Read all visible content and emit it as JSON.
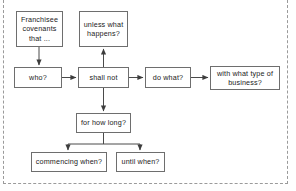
{
  "figure": {
    "type": "flowchart",
    "border_style": "dashed",
    "border_color": "#9a9a9a",
    "background": "#ffffff",
    "line_color": "#4a4a4a",
    "box_border_color": "#6e6e6e",
    "text_color": "#1b1b1b",
    "cut_caption": ""
  },
  "nodes": [
    {
      "id": "franchisee",
      "label": "Franchisee\ncovenants\nthat ...",
      "x": 16,
      "y": 11,
      "w": 47,
      "h": 36
    },
    {
      "id": "unless",
      "label": "unless what\nhappens?",
      "x": 79,
      "y": 11,
      "w": 49,
      "h": 36
    },
    {
      "id": "who",
      "label": "who?",
      "x": 14,
      "y": 67,
      "w": 48,
      "h": 21
    },
    {
      "id": "shallnot",
      "label": "shall not",
      "x": 78,
      "y": 67,
      "w": 51,
      "h": 21
    },
    {
      "id": "dowhat",
      "label": "do what?",
      "x": 145,
      "y": 67,
      "w": 46,
      "h": 21
    },
    {
      "id": "withtype",
      "label": "with what type of\nbusiness?",
      "x": 210,
      "y": 66,
      "w": 70,
      "h": 24
    },
    {
      "id": "howlong",
      "label": "for how long?",
      "x": 76,
      "y": 113,
      "w": 55,
      "h": 20
    },
    {
      "id": "commencing",
      "label": "commencing when?",
      "x": 31,
      "y": 152,
      "w": 76,
      "h": 20
    },
    {
      "id": "until",
      "label": "until when?",
      "x": 116,
      "y": 152,
      "w": 49,
      "h": 20
    }
  ],
  "edges": [
    {
      "from": "franchisee",
      "to": "who",
      "kind": "vertical-down"
    },
    {
      "from": "who",
      "to": "shallnot",
      "kind": "horizontal-right"
    },
    {
      "from": "shallnot",
      "to": "unless",
      "kind": "vertical-up"
    },
    {
      "from": "shallnot",
      "to": "dowhat",
      "kind": "horizontal-right"
    },
    {
      "from": "dowhat",
      "to": "withtype",
      "kind": "horizontal-right"
    },
    {
      "from": "shallnot",
      "to": "howlong",
      "kind": "vertical-down"
    },
    {
      "from": "howlong",
      "to": "commencing",
      "kind": "split-down-left"
    },
    {
      "from": "howlong",
      "to": "until",
      "kind": "split-down-right"
    }
  ]
}
